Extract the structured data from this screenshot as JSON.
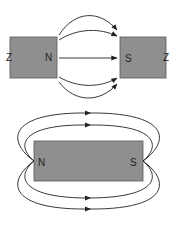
{
  "diagram": {
    "top": {
      "left_magnet": {
        "left_label": "Z",
        "right_label": "N"
      },
      "right_magnet": {
        "left_label": "S",
        "right_label": "Z"
      },
      "field_lines": 5
    },
    "bottom": {
      "magnet": {
        "left_label": "N",
        "right_label": "S"
      },
      "field_lines_above": 2,
      "field_lines_below": 2
    },
    "colors": {
      "magnet_fill": "#8f8f8f",
      "line": "#222222"
    }
  }
}
